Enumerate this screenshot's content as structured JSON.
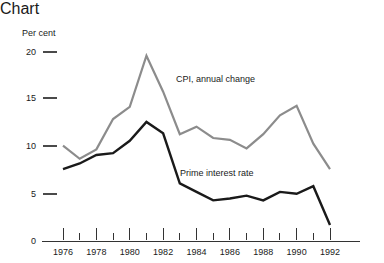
{
  "chart_data": {
    "type": "line",
    "title": "",
    "ylabel": "Per cent",
    "xlabel": "",
    "ylim": [
      0,
      20
    ],
    "yticks": [
      0,
      5,
      10,
      15,
      20
    ],
    "ytick_labels": [
      "0",
      "5",
      "10",
      "15",
      "20"
    ],
    "xlim": [
      1976,
      1992
    ],
    "x": [
      1976,
      1977,
      1978,
      1979,
      1980,
      1981,
      1982,
      1983,
      1984,
      1985,
      1986,
      1987,
      1988,
      1989,
      1990,
      1991,
      1992
    ],
    "xticks": [
      1976,
      1977,
      1978,
      1979,
      1980,
      1981,
      1982,
      1983,
      1984,
      1985,
      1986,
      1987,
      1988,
      1989,
      1990,
      1991,
      1992
    ],
    "xtick_labels": [
      "1976",
      "",
      "1978",
      "",
      "1980",
      "",
      "1982",
      "",
      "1984",
      "",
      "1986",
      "",
      "1988",
      "",
      "1990",
      "",
      "1992"
    ],
    "xtick_labels_visible": [
      "1976",
      "1978",
      "1980",
      "1982",
      "1984",
      "1986",
      "1988",
      "1990",
      "1992"
    ],
    "grid": false,
    "legend_position": "inline-annotation",
    "series": [
      {
        "name": "CPI, annual change",
        "color": "#8c8c8c",
        "linewidth": 2.2,
        "annotation": "CPI, annual change",
        "values": [
          10.1,
          8.7,
          9.7,
          12.9,
          14.2,
          19.6,
          15.8,
          11.3,
          12.1,
          10.9,
          10.7,
          9.8,
          11.3,
          13.3,
          14.3,
          10.3,
          7.6
        ]
      },
      {
        "name": "Prime interest rate",
        "color": "#1a1a1a",
        "linewidth": 2.4,
        "annotation": "Prime interest rate",
        "values": [
          7.6,
          8.2,
          9.1,
          9.3,
          10.6,
          12.6,
          11.4,
          6.1,
          5.2,
          4.3,
          4.5,
          4.8,
          4.3,
          5.2,
          5.0,
          5.8,
          1.7
        ]
      }
    ],
    "annotations": [
      {
        "text": "CPI, annual change",
        "x_px": 176,
        "y_px": 64
      },
      {
        "text": "Prime interest rate",
        "x_px": 180,
        "y_px": 158
      }
    ]
  },
  "axis": {
    "y_title": "Per cent",
    "y_labels": [
      "20",
      "15",
      "10",
      "5",
      "0"
    ],
    "x_labels": [
      "1976",
      "1978",
      "1980",
      "1982",
      "1984",
      "1986",
      "1988",
      "1990",
      "1992"
    ]
  },
  "colors": {
    "cpi_line": "#8c8c8c",
    "prime_line": "#1a1a1a",
    "axis": "#333333",
    "background": "#ffffff",
    "text": "#1a1a1a"
  }
}
